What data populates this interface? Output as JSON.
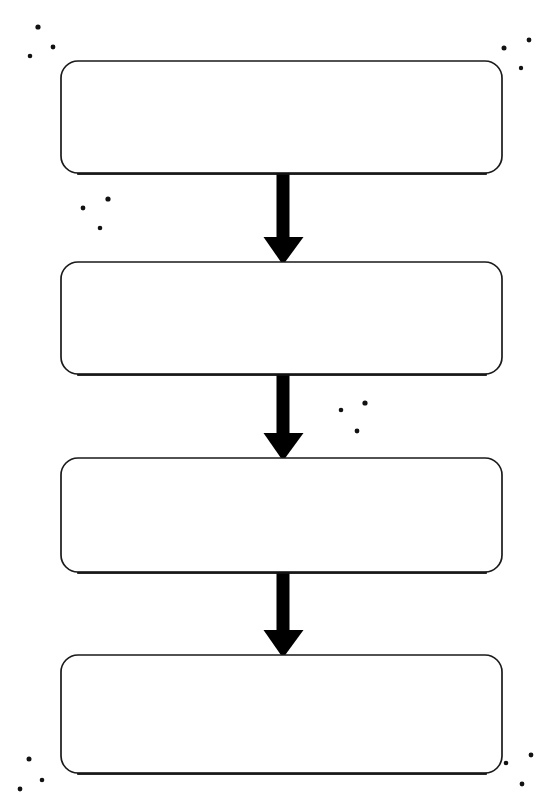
{
  "document": {
    "type": "flowchart",
    "title": "",
    "orientation": "vertical",
    "background_color": "#ffffff",
    "stroke_color": "#000000",
    "fill_color": "#ffffff",
    "media": "scanned-paper"
  },
  "diagram": {
    "nodes": [
      {
        "id": "node-1",
        "shape": "rounded-rectangle",
        "label": "",
        "x": 61,
        "y": 61,
        "width": 441,
        "height": 112,
        "corner_radius": 17
      },
      {
        "id": "node-2",
        "shape": "rounded-rectangle",
        "label": "",
        "x": 61,
        "y": 262,
        "width": 441,
        "height": 112,
        "corner_radius": 17
      },
      {
        "id": "node-3",
        "shape": "rounded-rectangle",
        "label": "",
        "x": 61,
        "y": 458,
        "width": 441,
        "height": 114,
        "corner_radius": 17
      },
      {
        "id": "node-4",
        "shape": "rounded-rectangle",
        "label": "",
        "x": 61,
        "y": 655,
        "width": 441,
        "height": 118,
        "corner_radius": 17
      }
    ],
    "connectors": [
      {
        "id": "arrow-1",
        "from": "node-1",
        "to": "node-2",
        "label": "",
        "direction": "down",
        "x_center": 283,
        "y_start": 173,
        "y_end": 265,
        "shaft_width": 13,
        "head_width": 39,
        "head_height": 28
      },
      {
        "id": "arrow-2",
        "from": "node-2",
        "to": "node-3",
        "label": "",
        "direction": "down",
        "x_center": 283,
        "y_start": 374,
        "y_end": 461,
        "shaft_width": 13,
        "head_width": 39,
        "head_height": 28
      },
      {
        "id": "arrow-3",
        "from": "node-3",
        "to": "node-4",
        "label": "",
        "direction": "down",
        "x_center": 283,
        "y_start": 572,
        "y_end": 658,
        "shaft_width": 13,
        "head_width": 39,
        "head_height": 28
      }
    ],
    "speckles": [
      {
        "x": 38,
        "y": 27,
        "r": 2.6
      },
      {
        "x": 53,
        "y": 47,
        "r": 2.4
      },
      {
        "x": 30,
        "y": 56,
        "r": 2.3
      },
      {
        "x": 529,
        "y": 40,
        "r": 2.4
      },
      {
        "x": 504,
        "y": 48,
        "r": 2.5
      },
      {
        "x": 521,
        "y": 68,
        "r": 2.2
      },
      {
        "x": 108,
        "y": 199,
        "r": 2.6
      },
      {
        "x": 83,
        "y": 208,
        "r": 2.4
      },
      {
        "x": 100,
        "y": 228,
        "r": 2.3
      },
      {
        "x": 365,
        "y": 403,
        "r": 2.6
      },
      {
        "x": 341,
        "y": 410,
        "r": 2.3
      },
      {
        "x": 357,
        "y": 431,
        "r": 2.4
      },
      {
        "x": 29,
        "y": 759,
        "r": 2.5
      },
      {
        "x": 42,
        "y": 780,
        "r": 2.3
      },
      {
        "x": 20,
        "y": 789,
        "r": 2.4
      },
      {
        "x": 531,
        "y": 755,
        "r": 2.4
      },
      {
        "x": 506,
        "y": 763,
        "r": 2.3
      },
      {
        "x": 522,
        "y": 784,
        "r": 2.4
      }
    ]
  }
}
